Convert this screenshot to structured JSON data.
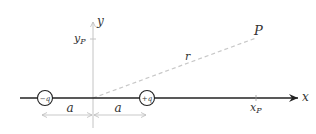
{
  "diagram": {
    "title": "",
    "axes": {
      "x_label": "x",
      "y_label": "y",
      "x_tick_label": "x",
      "x_tick_sub": "P",
      "y_tick_label": "y",
      "y_tick_sub": "P"
    },
    "charges": [
      {
        "label": "−q",
        "position": "left"
      },
      {
        "label": "+q",
        "position": "right"
      }
    ],
    "point": {
      "label": "P"
    },
    "distance": {
      "label": "r"
    },
    "dimensions": [
      {
        "label": "a"
      },
      {
        "label": "a"
      }
    ],
    "colors": {
      "axis": "#333333",
      "guide": "#bbbbbb",
      "dashed": "#c8c8c8",
      "text": "#333333"
    }
  }
}
